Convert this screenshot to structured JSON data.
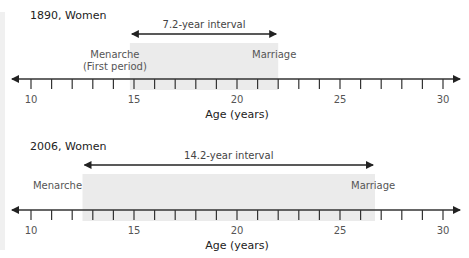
{
  "chart_data": {
    "type": "timeline",
    "xlabel": "Age (years)",
    "xlim": [
      8.8,
      31.5
    ],
    "ticks": [
      10,
      11,
      12,
      13,
      14,
      15,
      16,
      17,
      18,
      19,
      20,
      21,
      22,
      23,
      24,
      25,
      26,
      27,
      28,
      29,
      30
    ],
    "tick_labels": [
      10,
      15,
      20,
      25,
      30
    ],
    "panels": [
      {
        "title": "1890, Women",
        "start": 14.8,
        "end": 22.0,
        "interval_label": "7.2-year interval",
        "start_label": [
          "Menarche",
          "(First period)"
        ],
        "end_label": "Marriage"
      },
      {
        "title": "2006, Women",
        "start": 12.5,
        "end": 26.7,
        "interval_label": "14.2-year interval",
        "start_label": [
          "Menarche"
        ],
        "end_label": "Marriage"
      }
    ]
  },
  "colors": {
    "shade": "#ebebeb",
    "axis": "#333333"
  }
}
